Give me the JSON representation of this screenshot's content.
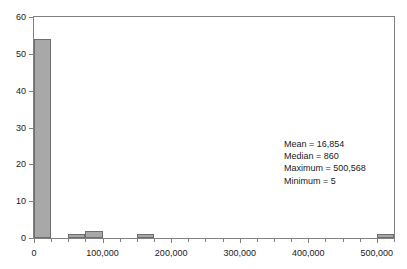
{
  "chart_data": {
    "type": "bar",
    "title": "",
    "xlabel": "",
    "ylabel": "",
    "xlim": [
      0,
      525000
    ],
    "ylim": [
      0,
      60
    ],
    "grid": false,
    "legend": null,
    "bin_width": 25000,
    "categories": [
      "0",
      "50,000",
      "75,000",
      "150,000",
      "500,000"
    ],
    "bins": [
      {
        "start": 0,
        "end": 25000,
        "value": 54
      },
      {
        "start": 50000,
        "end": 75000,
        "value": 1
      },
      {
        "start": 75000,
        "end": 100000,
        "value": 2
      },
      {
        "start": 150000,
        "end": 175000,
        "value": 1
      },
      {
        "start": 500000,
        "end": 525000,
        "value": 1
      }
    ],
    "values": [
      54,
      1,
      2,
      1,
      1
    ],
    "y_ticks": [
      0,
      10,
      20,
      30,
      40,
      50,
      60
    ],
    "y_tick_labels": [
      "0",
      "10",
      "20",
      "30",
      "40",
      "50",
      "60"
    ],
    "x_ticks": [
      0,
      100000,
      200000,
      300000,
      400000,
      500000
    ],
    "x_tick_labels": [
      "0",
      "100,000",
      "200,000",
      "300,000",
      "400,000",
      "500,000"
    ],
    "x_minor_tick_step": 25000,
    "annotations": [
      "Mean = 16,854",
      "Median = 860",
      "Maximum = 500,568",
      "Minimum = 5"
    ],
    "colors": {
      "bar_fill": "#a8a8a8",
      "bar_edge": "#6e6e6e",
      "axis": "#808080",
      "text": "#1a1a1a",
      "background": "#ffffff"
    }
  },
  "stats": {
    "mean": "Mean = 16,854",
    "median": "Median = 860",
    "maximum": "Maximum = 500,568",
    "minimum": "Minimum = 5"
  }
}
